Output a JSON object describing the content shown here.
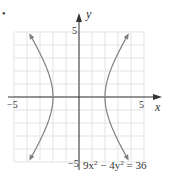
{
  "chart_data": {
    "type": "line",
    "title": "",
    "equation": "9x² − 4y² = 36",
    "equation_parts": {
      "a": "9x",
      "b": " − 4y",
      "c": " = 36",
      "sup": "2"
    },
    "xlabel": "x",
    "ylabel": "y",
    "xlim": [
      -5,
      5
    ],
    "ylim": [
      -5,
      5
    ],
    "grid": true,
    "grid_step": 1,
    "tick_labels": {
      "x_min": "−5",
      "x_max": "5",
      "y_min": "−5",
      "y_max": "5"
    },
    "series": [
      {
        "name": "right branch",
        "x": [
          3.89,
          3.2,
          2.6,
          2.2,
          2.0,
          2.2,
          2.6,
          3.2,
          3.89
        ],
        "y": [
          5,
          3.81,
          2.49,
          1.38,
          0,
          -1.38,
          -2.49,
          -3.81,
          -5
        ]
      },
      {
        "name": "left branch",
        "x": [
          -3.89,
          -3.2,
          -2.6,
          -2.2,
          -2.0,
          -2.2,
          -2.6,
          -3.2,
          -3.89
        ],
        "y": [
          5,
          3.81,
          2.49,
          1.38,
          0,
          -1.38,
          -2.49,
          -3.81,
          -5
        ]
      }
    ],
    "colors": {
      "curve": "#808080",
      "axis": "#333333",
      "grid": "#e3e3e3",
      "label": "#555555"
    }
  },
  "bullet": "•"
}
